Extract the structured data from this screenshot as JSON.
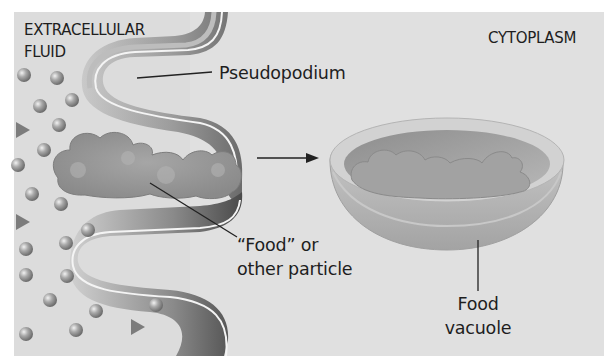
{
  "figure": {
    "background_color": "#dcdcdc",
    "regions": {
      "extracellular": {
        "line1": "EXTRACELLULAR",
        "line2": "FLUID"
      },
      "cytoplasm": {
        "label": "CYTOPLASM"
      }
    },
    "labels": {
      "pseudopodium": "Pseudopodium",
      "food_particle": {
        "line1": "“Food” or",
        "line2": "other particle"
      },
      "food_vacuole": {
        "line1": "Food",
        "line2": "vacuole"
      }
    },
    "particles": {
      "spheres": [
        [
          24,
          75
        ],
        [
          57,
          78
        ],
        [
          40,
          106
        ],
        [
          72,
          100
        ],
        [
          59,
          125
        ],
        [
          44,
          150
        ],
        [
          18,
          165
        ],
        [
          32,
          194
        ],
        [
          61,
          204
        ],
        [
          66,
          243
        ],
        [
          88,
          230
        ],
        [
          26,
          249
        ],
        [
          26,
          275
        ],
        [
          67,
          276
        ],
        [
          50,
          300
        ],
        [
          96,
          311
        ],
        [
          156,
          305
        ],
        [
          26,
          334
        ],
        [
          76,
          330
        ]
      ],
      "triangles": [
        [
          22,
          130
        ],
        [
          22,
          222
        ],
        [
          137,
          327
        ]
      ]
    },
    "arrow": {
      "from": [
        257,
        158
      ],
      "to": [
        318,
        158
      ]
    }
  }
}
